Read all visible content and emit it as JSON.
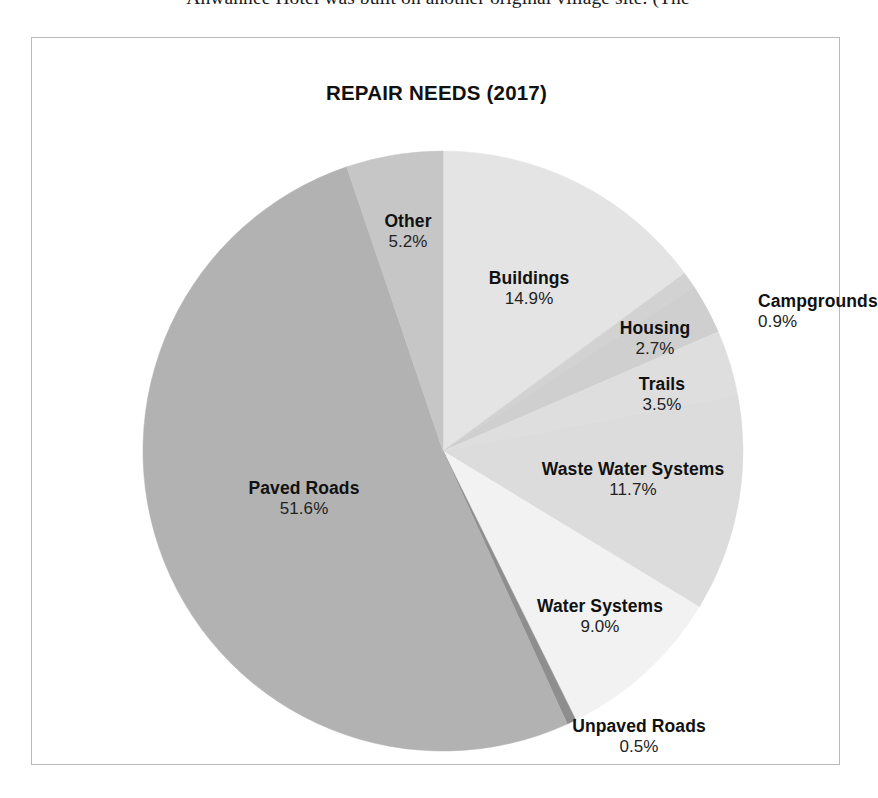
{
  "page": {
    "top_text_fragment": "Ahwahnee Hotel was built on another original village site. (The"
  },
  "figure": {
    "title": "REPAIR NEEDS (2017)"
  },
  "chart_data": {
    "type": "pie",
    "title": "REPAIR NEEDS (2017)",
    "xlabel": "",
    "ylabel": "",
    "units": "percent",
    "start_angle_deg": 0,
    "direction": "clockwise",
    "legend": "none",
    "grid": false,
    "categories": [
      "Buildings",
      "Campgrounds",
      "Housing",
      "Trails",
      "Waste Water Systems",
      "Water Systems",
      "Unpaved Roads",
      "Paved Roads",
      "Other"
    ],
    "values": [
      14.9,
      0.9,
      2.7,
      3.5,
      11.7,
      9.0,
      0.5,
      51.6,
      5.2
    ],
    "value_labels": [
      "14.9%",
      "0.9%",
      "2.7%",
      "3.5%",
      "11.7%",
      "9.0%",
      "0.5%",
      "51.6%",
      "5.2%"
    ],
    "colors": [
      "#e4e4e4",
      "#d2d2d2",
      "#cfcfcf",
      "#dedede",
      "#dcdcdc",
      "#f2f2f2",
      "#8e8e8e",
      "#b2b2b2",
      "#c6c6c6"
    ],
    "slices": [
      {
        "label": "Buildings",
        "value": 14.9,
        "pct_text": "14.9%",
        "color": "#e4e4e4",
        "label_x": 497,
        "label_y": 231,
        "outside": false,
        "align": "center"
      },
      {
        "label": "Campgrounds",
        "value": 0.9,
        "pct_text": "0.9%",
        "color": "#d2d2d2",
        "label_x": 726,
        "label_y": 254,
        "outside": true,
        "align": "left"
      },
      {
        "label": "Housing",
        "value": 2.7,
        "pct_text": "2.7%",
        "color": "#cfcfcf",
        "label_x": 623,
        "label_y": 281,
        "outside": false,
        "align": "center"
      },
      {
        "label": "Trails",
        "value": 3.5,
        "pct_text": "3.5%",
        "color": "#dedede",
        "label_x": 630,
        "label_y": 337,
        "outside": false,
        "align": "center"
      },
      {
        "label": "Waste Water Systems",
        "value": 11.7,
        "pct_text": "11.7%",
        "color": "#dcdcdc",
        "label_x": 601,
        "label_y": 422,
        "outside": false,
        "align": "center"
      },
      {
        "label": "Water Systems",
        "value": 9.0,
        "pct_text": "9.0%",
        "color": "#f2f2f2",
        "label_x": 568,
        "label_y": 559,
        "outside": false,
        "align": "center"
      },
      {
        "label": "Unpaved Roads",
        "value": 0.5,
        "pct_text": "0.5%",
        "color": "#8e8e8e",
        "label_x": 607,
        "label_y": 679,
        "outside": true,
        "align": "center"
      },
      {
        "label": "Paved Roads",
        "value": 51.6,
        "pct_text": "51.6%",
        "color": "#b2b2b2",
        "label_x": 272,
        "label_y": 441,
        "outside": false,
        "align": "center"
      },
      {
        "label": "Other",
        "value": 5.2,
        "pct_text": "5.2%",
        "color": "#c6c6c6",
        "label_x": 376,
        "label_y": 174,
        "outside": false,
        "align": "center"
      }
    ],
    "geometry": {
      "center_x": 411,
      "center_y": 413,
      "radius": 300
    }
  }
}
